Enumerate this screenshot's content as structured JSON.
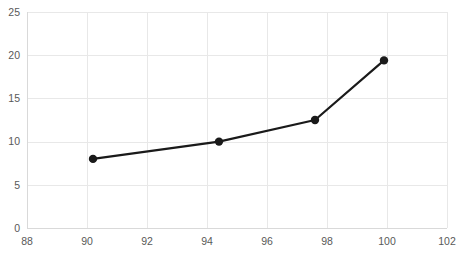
{
  "chart_data": {
    "type": "line",
    "title": "",
    "subtitle": "",
    "xlabel": "",
    "ylabel": "",
    "xlim": [
      88,
      102
    ],
    "ylim": [
      0,
      25
    ],
    "x_ticks": [
      88,
      90,
      92,
      94,
      96,
      98,
      100,
      102
    ],
    "y_ticks": [
      0,
      5,
      10,
      15,
      20,
      25
    ],
    "x_tick_labels": [
      "88",
      "90",
      "92",
      "94",
      "96",
      "98",
      "100",
      "102"
    ],
    "y_tick_labels": [
      "0",
      "5",
      "10",
      "15",
      "20",
      "25"
    ],
    "grid": true,
    "grid_axes": "both",
    "legend": false,
    "legend_position": "none",
    "series": [
      {
        "name": "series-1",
        "marker": "circle",
        "x": [
          90.2,
          94.4,
          97.6,
          99.9
        ],
        "y": [
          8.0,
          10.0,
          12.5,
          19.4
        ],
        "points": [
          {
            "x": 90.2,
            "y": 8.0
          },
          {
            "x": 94.4,
            "y": 10.0
          },
          {
            "x": 97.6,
            "y": 12.5
          },
          {
            "x": 99.9,
            "y": 19.4
          }
        ]
      }
    ]
  },
  "style": {
    "line_color": "#1a1a1a",
    "marker_color": "#1a1a1a",
    "grid_color": "#e8e8e8",
    "axis_color": "#d9d9d9",
    "tick_label_color": "#595959",
    "background_color": "#ffffff",
    "line_width": 2.2,
    "marker_radius": 4.2
  },
  "plot_area": {
    "left": 27,
    "right": 447,
    "top": 12,
    "bottom": 228
  }
}
